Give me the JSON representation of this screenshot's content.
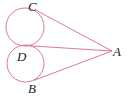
{
  "figure": {
    "type": "geometry-diagram",
    "canvas": {
      "width": 127,
      "height": 96,
      "background": "#ffffff"
    },
    "stroke": {
      "color": "#db7a90",
      "width": 1
    },
    "label_color": "#1d1d1d",
    "labels": [
      {
        "id": "C",
        "text": "C",
        "x": 28,
        "y": 0
      },
      {
        "id": "D",
        "text": "D",
        "x": 17,
        "y": 50
      },
      {
        "id": "B",
        "text": "B",
        "x": 28,
        "y": 82
      },
      {
        "id": "A",
        "text": "A",
        "x": 113,
        "y": 45
      }
    ],
    "circles": [
      {
        "id": "upper-circle",
        "cx": 25,
        "cy": 27,
        "r": 19
      },
      {
        "id": "lower-circle",
        "cx": 25.5,
        "cy": 63.5,
        "r": 18.5
      }
    ],
    "lines": [
      {
        "id": "tangent-upper",
        "x1": 36.5,
        "y1": 10.5,
        "x2": 112,
        "y2": 51
      },
      {
        "id": "through-tangency",
        "x1": 25,
        "y1": 45.5,
        "x2": 112,
        "y2": 51
      },
      {
        "id": "tangent-lower",
        "x1": 33.5,
        "y1": 80.5,
        "x2": 112,
        "y2": 51
      }
    ],
    "vertex_point": {
      "id": "A",
      "x": 112,
      "y": 51
    }
  }
}
